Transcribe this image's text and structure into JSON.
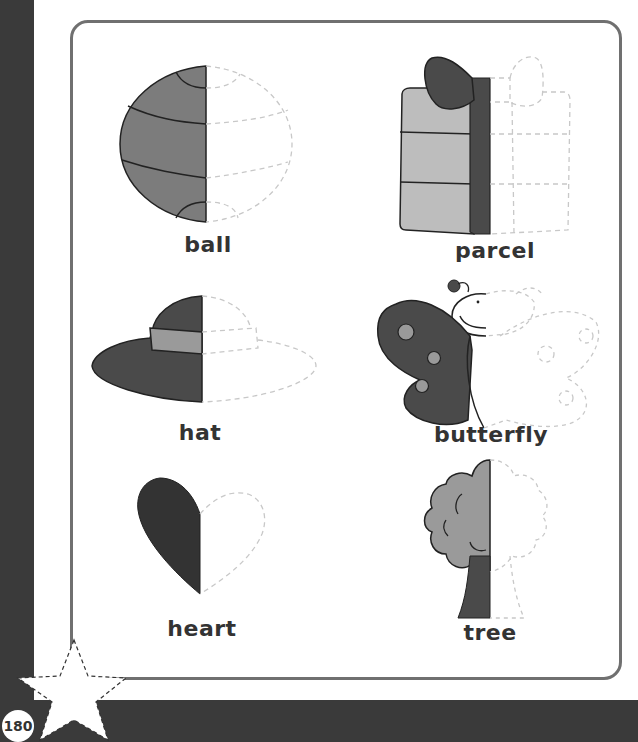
{
  "page": {
    "number": "180",
    "colors": {
      "frame": "#3a3a3a",
      "panel_border": "#707070",
      "fill_dark": "#4a4a4a",
      "fill_mid": "#7c7c7c",
      "fill_light": "#bdbdbd",
      "trace_dash": "#c8c8c8",
      "text": "#333333"
    }
  },
  "activity": {
    "instruction": "Trace the dashed half of each picture",
    "items": [
      {
        "id": "ball",
        "label": "ball",
        "icon": "ball-half-icon"
      },
      {
        "id": "parcel",
        "label": "parcel",
        "icon": "parcel-half-icon"
      },
      {
        "id": "hat",
        "label": "hat",
        "icon": "hat-half-icon"
      },
      {
        "id": "butterfly",
        "label": "butterfly",
        "icon": "butterfly-half-icon"
      },
      {
        "id": "heart",
        "label": "heart",
        "icon": "heart-half-icon"
      },
      {
        "id": "tree",
        "label": "tree",
        "icon": "tree-half-icon"
      }
    ]
  }
}
